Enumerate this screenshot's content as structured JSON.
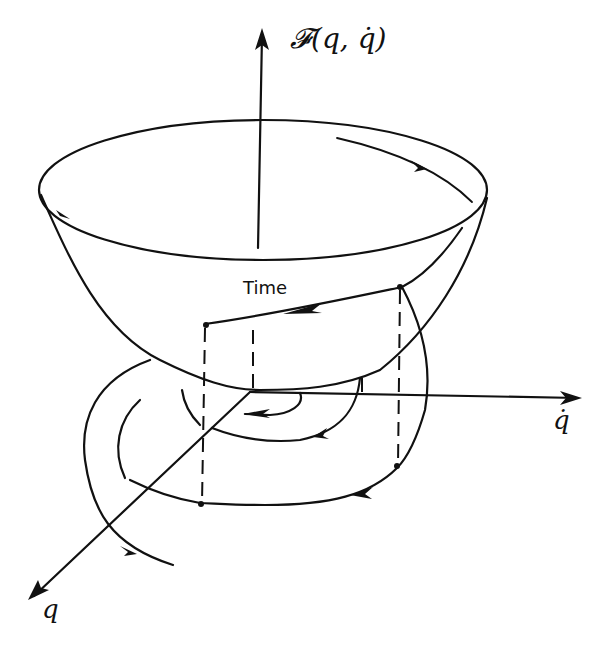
{
  "diagram": {
    "type": "3D energy-function bowl with spiralling phase-plane trajectory",
    "labels": {
      "vertical_axis": "𝓕(q, q̇)",
      "right_axis": "q̇",
      "front_axis": "q",
      "surface_trajectory": "Time"
    },
    "colors": {
      "ink": "#111111",
      "background": "#ffffff"
    }
  }
}
